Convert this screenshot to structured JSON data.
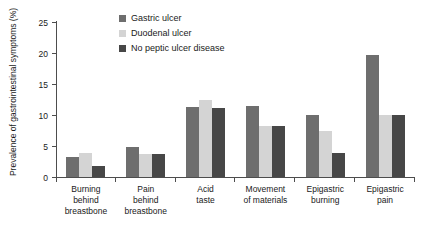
{
  "chart_data": {
    "type": "bar",
    "title": "",
    "xlabel": "",
    "ylabel": "Prevalence of gastrointestinal symptoms (%)",
    "ylim": [
      0,
      25
    ],
    "yticks": [
      0,
      5,
      10,
      15,
      20,
      25
    ],
    "grid": false,
    "legend_position": "top-center",
    "categories": [
      "Burning behind breastbone",
      "Pain behind breastbone",
      "Acid taste",
      "Movement of materials",
      "Epigastric burning",
      "Epigastric pain"
    ],
    "category_lines": [
      [
        "Burning",
        "behind",
        "breastbone"
      ],
      [
        "Pain",
        "behind",
        "breastbone"
      ],
      [
        "Acid",
        "taste"
      ],
      [
        "Movement",
        "of materials"
      ],
      [
        "Epigastric",
        "burning"
      ],
      [
        "Epigastric",
        "pain"
      ]
    ],
    "series": [
      {
        "name": "Gastric ulcer",
        "color": "#6e6e6e",
        "values": [
          3.2,
          4.8,
          11.3,
          11.4,
          10.0,
          19.6
        ]
      },
      {
        "name": "Duodenal ulcer",
        "color": "#d4d4d4",
        "values": [
          3.8,
          3.7,
          12.4,
          8.3,
          7.4,
          10.0
        ]
      },
      {
        "name": "No peptic ulcer disease",
        "color": "#474747",
        "values": [
          1.7,
          3.7,
          11.1,
          8.2,
          3.8,
          10.0
        ]
      }
    ]
  },
  "colors": {
    "axis": "#4d4d4d",
    "text": "#1a1a1a",
    "background": "#ffffff",
    "series1": "#6e6e6e",
    "series2": "#d4d4d4",
    "series3": "#474747"
  }
}
